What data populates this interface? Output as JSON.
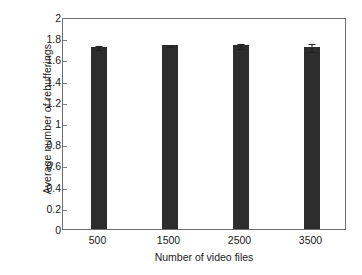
{
  "chart_data": {
    "type": "bar",
    "title": "",
    "xlabel": "Number of video files",
    "ylabel": "Average number of rebufferings",
    "categories": [
      "500",
      "1500",
      "2500",
      "3500"
    ],
    "values": [
      1.72,
      1.74,
      1.74,
      1.72
    ],
    "errors": [
      0.022,
      0.018,
      0.028,
      0.042
    ],
    "ylim": [
      0,
      2
    ],
    "yticks": [
      "0",
      "0.2",
      "0.4",
      "0.6",
      "0.8",
      "1",
      "1.2",
      "1.4",
      "1.6",
      "1.8",
      "2"
    ],
    "ytick_values": [
      0,
      0.2,
      0.4,
      0.6,
      0.8,
      1,
      1.2,
      1.4,
      1.6,
      1.8,
      2
    ],
    "grid": false,
    "legend": null,
    "bar_color": "#2d2d2d",
    "axis_color": "#6e6e6e",
    "error_bar_color": "#1f1f1f"
  }
}
